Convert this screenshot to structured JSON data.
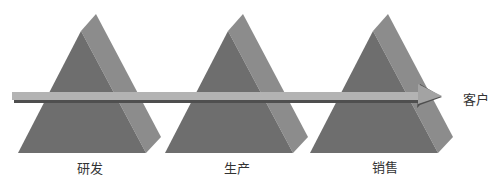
{
  "diagram": {
    "stages": [
      {
        "label": "研发",
        "center_x": 90
      },
      {
        "label": "生产",
        "center_x": 237
      },
      {
        "label": "销售",
        "center_x": 384
      }
    ],
    "target_label": "客户",
    "colors": {
      "front_face": "#6e6e6e",
      "side_face": "#8c8c8c",
      "arrow_top": "#b0b0b0",
      "arrow_shadow": "#5a5a5a",
      "text": "#333333"
    }
  }
}
